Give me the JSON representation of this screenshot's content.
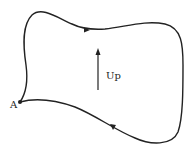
{
  "diagram": {
    "point_label": "A",
    "direction_label": "Up",
    "curve_color": "#222222",
    "background": "#ffffff"
  }
}
